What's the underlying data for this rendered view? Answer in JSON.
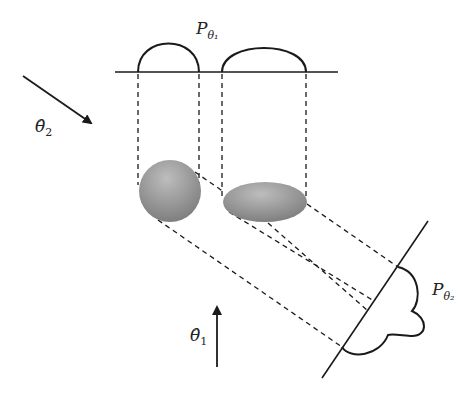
{
  "diagram": {
    "colors": {
      "line": "#1a1a1a",
      "object_light": "#b5b5b5",
      "object_dark": "#7a7a7a",
      "background": "#ffffff"
    },
    "labels": {
      "projection_1": {
        "main": "P",
        "sub": "θ₁"
      },
      "projection_2": {
        "main": "P",
        "sub": "θ₂"
      },
      "direction_1": {
        "main": "θ̂",
        "sub": "1"
      },
      "direction_2": {
        "main": "θ̂",
        "sub": "2"
      }
    },
    "objects": [
      {
        "name": "circle-object",
        "shape": "circle"
      },
      {
        "name": "ellipse-object",
        "shape": "ellipse"
      }
    ]
  }
}
